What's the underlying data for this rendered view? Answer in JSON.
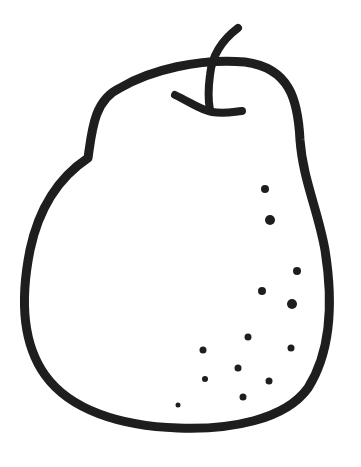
{
  "image": {
    "subject": "pear line drawing",
    "stroke_color": "#1e1e1e",
    "background_color": "#ffffff",
    "stroke_width": 9
  },
  "dots": [
    {
      "x": 265,
      "y": 189,
      "r": 4
    },
    {
      "x": 270,
      "y": 220,
      "r": 5
    },
    {
      "x": 297,
      "y": 271,
      "r": 4
    },
    {
      "x": 262,
      "y": 291,
      "r": 4
    },
    {
      "x": 292,
      "y": 304,
      "r": 5
    },
    {
      "x": 248,
      "y": 337,
      "r": 3.5
    },
    {
      "x": 203,
      "y": 350,
      "r": 3.5
    },
    {
      "x": 291,
      "y": 348,
      "r": 3.5
    },
    {
      "x": 238,
      "y": 368,
      "r": 3.5
    },
    {
      "x": 205,
      "y": 379,
      "r": 3
    },
    {
      "x": 269,
      "y": 381,
      "r": 3.5
    },
    {
      "x": 243,
      "y": 397,
      "r": 3.5
    },
    {
      "x": 178,
      "y": 405,
      "r": 2.5
    }
  ]
}
